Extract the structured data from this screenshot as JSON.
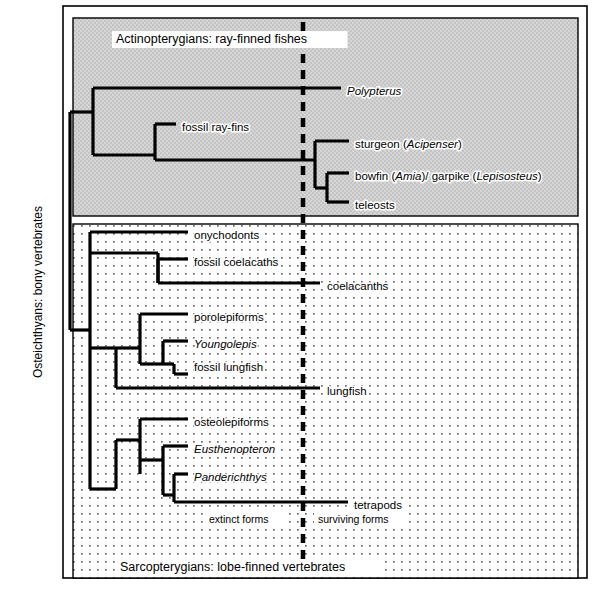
{
  "figure": {
    "outer_frame": {
      "x": 63,
      "y": 6,
      "width": 524,
      "height": 572
    },
    "vertical_axis_label": "Osteichthyans: bony vertebrates"
  },
  "panels": [
    {
      "id": "actinopterygians",
      "caption": "Actinopterygians: ray-finned fishes",
      "fill": "#cfcfcf",
      "box": {
        "x": 73,
        "y": 18,
        "width": 505,
        "height": 198
      },
      "caption_pos": {
        "x": 116,
        "y": 40
      }
    },
    {
      "id": "sarcopterygians",
      "caption": "Sarcopterygians: lobe-finned vertebrates",
      "fill": "#fdfdfd",
      "box": {
        "x": 73,
        "y": 224,
        "width": 505,
        "height": 354
      },
      "caption_pos": {
        "x": 120,
        "y": 568
      }
    }
  ],
  "divider": {
    "name": "extinct-surviving-divider",
    "x": 303,
    "y1": 22,
    "y2": 574,
    "dash": "9 7",
    "width": 4.5,
    "color": "#000000"
  },
  "zone_labels": [
    {
      "text": "extinct forms",
      "x": 209,
      "y": 520,
      "anchor": "start"
    },
    {
      "text": "surviving forms",
      "x": 318,
      "y": 520,
      "anchor": "start"
    }
  ],
  "chart_data": {
    "type": "cladogram",
    "root": {
      "x": 70,
      "y_top": 112,
      "y_bottom": 330
    },
    "taxa": [
      {
        "name": "Polypterus",
        "italic": true,
        "group": "actinopterygians",
        "tip_x": 341,
        "tip_y": 88,
        "label_x": 347,
        "label_y": 92,
        "extinct": false
      },
      {
        "name": "fossil ray-fins",
        "italic": false,
        "group": "actinopterygians",
        "tip_x": 176,
        "tip_y": 124,
        "label_x": 182,
        "label_y": 128,
        "extinct": true
      },
      {
        "name": "sturgeon (Acipenser)",
        "italic_part": "Acipenser",
        "group": "actinopterygians",
        "tip_x": 349,
        "tip_y": 141,
        "label_x": 355,
        "label_y": 145,
        "extinct": false
      },
      {
        "name": "bowfin (Amia)/ garpike (Lepisosteus)",
        "italic_part": "Amia|Lepisosteus",
        "group": "actinopterygians",
        "tip_x": 349,
        "tip_y": 173,
        "label_x": 355,
        "label_y": 177,
        "extinct": false
      },
      {
        "name": "teleosts",
        "italic": false,
        "group": "actinopterygians",
        "tip_x": 349,
        "tip_y": 202,
        "label_x": 355,
        "label_y": 206,
        "extinct": false
      },
      {
        "name": "onychodonts",
        "italic": false,
        "group": "sarcopterygians",
        "tip_x": 188,
        "tip_y": 232,
        "label_x": 194,
        "label_y": 236,
        "extinct": true
      },
      {
        "name": "fossil coelacaths",
        "italic": false,
        "group": "sarcopterygians",
        "tip_x": 188,
        "tip_y": 259,
        "label_x": 194,
        "label_y": 263,
        "extinct": true
      },
      {
        "name": "coelacanths",
        "italic": false,
        "group": "sarcopterygians",
        "tip_x": 320,
        "tip_y": 283,
        "label_x": 327,
        "label_y": 287,
        "extinct": false
      },
      {
        "name": "porolepiforms",
        "italic": false,
        "group": "sarcopterygians",
        "tip_x": 188,
        "tip_y": 314,
        "label_x": 194,
        "label_y": 318,
        "extinct": true
      },
      {
        "name": "Youngolepis",
        "italic": true,
        "group": "sarcopterygians",
        "tip_x": 188,
        "tip_y": 341,
        "label_x": 194,
        "label_y": 345,
        "extinct": true
      },
      {
        "name": "fossil lungfish",
        "italic": false,
        "group": "sarcopterygians",
        "tip_x": 188,
        "tip_y": 364,
        "label_x": 194,
        "label_y": 368,
        "extinct": true
      },
      {
        "name": "lungfish",
        "italic": false,
        "group": "sarcopterygians",
        "tip_x": 320,
        "tip_y": 388,
        "label_x": 327,
        "label_y": 392,
        "extinct": false
      },
      {
        "name": "osteolepiforms",
        "italic": false,
        "group": "sarcopterygians",
        "tip_x": 188,
        "tip_y": 419,
        "label_x": 194,
        "label_y": 423,
        "extinct": true
      },
      {
        "name": "Eusthenopteron",
        "italic": true,
        "group": "sarcopterygians",
        "tip_x": 188,
        "tip_y": 446,
        "label_x": 194,
        "label_y": 450,
        "extinct": true
      },
      {
        "name": "Panderichthys",
        "italic": true,
        "group": "sarcopterygians",
        "tip_x": 188,
        "tip_y": 474,
        "label_x": 194,
        "label_y": 478,
        "extinct": true
      },
      {
        "name": "tetrapods",
        "italic": false,
        "group": "sarcopterygians",
        "tip_x": 348,
        "tip_y": 502,
        "label_x": 354,
        "label_y": 506,
        "extinct": false
      }
    ],
    "branch_segments": [
      {
        "type": "v",
        "x": 70,
        "y1": 112,
        "y2": 330
      },
      {
        "type": "h",
        "y": 112,
        "x1": 70,
        "x2": 93
      },
      {
        "type": "v",
        "x": 93,
        "y1": 88,
        "y2": 155
      },
      {
        "type": "h",
        "y": 88,
        "x1": 93,
        "x2": 341
      },
      {
        "type": "h",
        "y": 155,
        "x1": 93,
        "x2": 155
      },
      {
        "type": "v",
        "x": 155,
        "y1": 124,
        "y2": 155
      },
      {
        "type": "h",
        "y": 124,
        "x1": 155,
        "x2": 176
      },
      {
        "type": "v",
        "x": 155,
        "y1": 155,
        "y2": 160
      },
      {
        "type": "h",
        "y": 160,
        "x1": 155,
        "x2": 315
      },
      {
        "type": "v",
        "x": 315,
        "y1": 141,
        "y2": 188
      },
      {
        "type": "h",
        "y": 141,
        "x1": 315,
        "x2": 349
      },
      {
        "type": "h",
        "y": 188,
        "x1": 315,
        "x2": 327
      },
      {
        "type": "v",
        "x": 327,
        "y1": 173,
        "y2": 202
      },
      {
        "type": "h",
        "y": 173,
        "x1": 327,
        "x2": 349
      },
      {
        "type": "h",
        "y": 202,
        "x1": 327,
        "x2": 349
      },
      {
        "type": "h",
        "y": 330,
        "x1": 70,
        "x2": 90
      },
      {
        "type": "v",
        "x": 90,
        "y1": 232,
        "y2": 489
      },
      {
        "type": "h",
        "y": 232,
        "x1": 90,
        "x2": 188
      },
      {
        "type": "h",
        "y": 253,
        "x1": 90,
        "x2": 158
      },
      {
        "type": "v",
        "x": 158,
        "y1": 253,
        "y2": 283
      },
      {
        "type": "h",
        "y": 259,
        "x1": 158,
        "x2": 188
      },
      {
        "type": "v",
        "x": 158,
        "y1": 259,
        "y2": 283
      },
      {
        "type": "h",
        "y": 283,
        "x1": 158,
        "x2": 320
      },
      {
        "type": "h",
        "y": 348,
        "x1": 90,
        "x2": 116
      },
      {
        "type": "v",
        "x": 116,
        "y1": 348,
        "y2": 388
      },
      {
        "type": "h",
        "y": 388,
        "x1": 116,
        "x2": 320
      },
      {
        "type": "v",
        "x": 140,
        "y1": 314,
        "y2": 364
      },
      {
        "type": "h",
        "y": 348,
        "x1": 116,
        "x2": 140
      },
      {
        "type": "h",
        "y": 314,
        "x1": 140,
        "x2": 188
      },
      {
        "type": "v",
        "x": 163,
        "y1": 341,
        "y2": 364
      },
      {
        "type": "h",
        "y": 364,
        "x1": 140,
        "x2": 163
      },
      {
        "type": "h",
        "y": 341,
        "x1": 163,
        "x2": 188
      },
      {
        "type": "h",
        "y": 364,
        "x1": 163,
        "x2": 174
      },
      {
        "type": "v",
        "x": 174,
        "y1": 364,
        "y2": 374
      },
      {
        "type": "h",
        "y": 374,
        "x1": 174,
        "x2": 188
      },
      {
        "type": "h",
        "y": 489,
        "x1": 90,
        "x2": 116
      },
      {
        "type": "v",
        "x": 116,
        "y1": 440,
        "y2": 489
      },
      {
        "type": "h",
        "y": 440,
        "x1": 116,
        "x2": 140
      },
      {
        "type": "v",
        "x": 140,
        "y1": 419,
        "y2": 474
      },
      {
        "type": "h",
        "y": 419,
        "x1": 140,
        "x2": 188
      },
      {
        "type": "h",
        "y": 460,
        "x1": 140,
        "x2": 163
      },
      {
        "type": "v",
        "x": 163,
        "y1": 446,
        "y2": 495
      },
      {
        "type": "h",
        "y": 446,
        "x1": 163,
        "x2": 188
      },
      {
        "type": "h",
        "y": 495,
        "x1": 163,
        "x2": 174
      },
      {
        "type": "v",
        "x": 174,
        "y1": 474,
        "y2": 502
      },
      {
        "type": "h",
        "y": 474,
        "x1": 174,
        "x2": 188
      },
      {
        "type": "h",
        "y": 502,
        "x1": 174,
        "x2": 348
      }
    ],
    "line_color": "#000000",
    "line_width": 3.2
  }
}
